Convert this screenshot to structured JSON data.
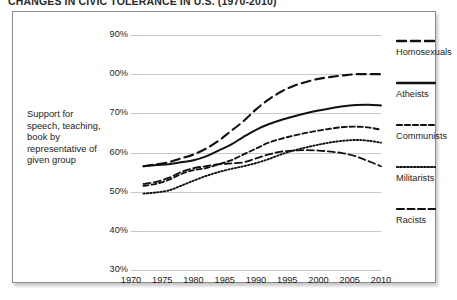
{
  "title": "CHANGES IN CIVIC TOLERANCE IN U.S. (1970-2010)",
  "caption": "Support for speech, teaching, book by representative of given group",
  "axis": {
    "y_ticks": [
      "90%",
      "00%",
      "70%",
      "60%",
      "50%",
      "40%",
      "30%"
    ],
    "x_ticks": [
      "1970",
      "1975",
      "1980",
      "1985",
      "1990",
      "1995",
      "2000",
      "2005",
      "2010"
    ]
  },
  "legend": [
    {
      "label": "Homosexuals",
      "dash": "9,5",
      "width": 2.1
    },
    {
      "label": "Atheists",
      "dash": "none",
      "width": 2.0
    },
    {
      "label": "Communists",
      "dash": "5,3",
      "width": 1.9
    },
    {
      "label": "Militarists",
      "dash": "1.4,2",
      "width": 1.9
    },
    {
      "label": "Racists",
      "dash": "7,3.5",
      "width": 1.8
    }
  ],
  "chart_data": {
    "type": "line",
    "title": "CHANGES IN CIVIC TOLERANCE IN U.S. (1970-2010)",
    "xlabel": "",
    "ylabel": "Support for speech, teaching, book by representative of given group",
    "xlim": [
      1970,
      2010
    ],
    "ylim": [
      30,
      90
    ],
    "grid": "horizontal",
    "legend_position": "right-outside",
    "x": [
      1972,
      1974,
      1976,
      1978,
      1980,
      1982,
      1984,
      1986,
      1988,
      1990,
      1992,
      1994,
      1996,
      1998,
      2000,
      2002,
      2004,
      2006,
      2008,
      2010
    ],
    "series": [
      {
        "name": "Homosexuals",
        "values": [
          56.5,
          57.0,
          57.5,
          58.5,
          59.5,
          61.0,
          63.0,
          65.5,
          68.0,
          71.0,
          73.5,
          75.5,
          77.0,
          78.0,
          78.8,
          79.3,
          79.7,
          80.0,
          80.0,
          80.0
        ]
      },
      {
        "name": "Atheists",
        "values": [
          56.5,
          56.8,
          57.0,
          57.5,
          58.0,
          59.0,
          60.5,
          62.0,
          64.0,
          65.8,
          67.2,
          68.3,
          69.2,
          70.0,
          70.7,
          71.3,
          71.8,
          72.1,
          72.2,
          72.0
        ]
      },
      {
        "name": "Communists",
        "values": [
          51.5,
          52.0,
          53.0,
          54.5,
          55.5,
          56.0,
          57.0,
          58.0,
          59.5,
          61.0,
          62.5,
          63.5,
          64.3,
          65.0,
          65.6,
          66.1,
          66.5,
          66.6,
          66.4,
          65.8
        ]
      },
      {
        "name": "Militarists",
        "values": [
          49.5,
          49.8,
          50.3,
          51.5,
          52.8,
          54.0,
          55.0,
          55.8,
          56.5,
          57.3,
          58.3,
          59.5,
          60.5,
          61.3,
          62.0,
          62.6,
          63.0,
          63.2,
          63.0,
          62.5
        ]
      },
      {
        "name": "Racists",
        "values": [
          52.0,
          52.5,
          53.5,
          55.0,
          56.0,
          56.5,
          57.0,
          57.2,
          57.5,
          58.5,
          59.5,
          60.2,
          60.5,
          60.6,
          60.5,
          60.2,
          59.8,
          59.0,
          57.8,
          56.5
        ]
      }
    ]
  }
}
